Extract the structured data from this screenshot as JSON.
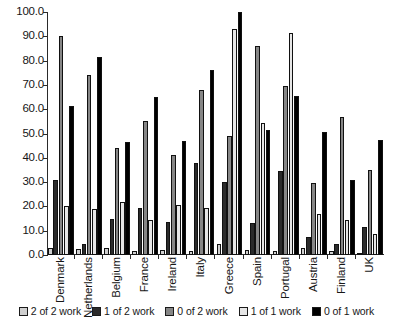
{
  "chart_data": {
    "type": "bar",
    "title": "",
    "xlabel": "",
    "ylabel": "",
    "ylim": [
      0,
      100
    ],
    "yticks": [
      "0.0",
      "10.0",
      "20.0",
      "30.0",
      "40.0",
      "50.0",
      "60.0",
      "70.0",
      "80.0",
      "90.0",
      "100.0"
    ],
    "ytick_values": [
      0,
      10,
      20,
      30,
      40,
      50,
      60,
      70,
      80,
      90,
      100
    ],
    "grid": false,
    "legend_position": "bottom",
    "categories": [
      "Denmark",
      "Netherlands",
      "Belgium",
      "France",
      "Ireland",
      "Italy",
      "Greece",
      "Spain",
      "Portugal",
      "Austria",
      "Finland",
      "UK"
    ],
    "series": [
      {
        "name": "2 of 2 work",
        "color": "#cfcfcf",
        "values": [
          2.8,
          2.5,
          3.0,
          1.8,
          2.2,
          1.5,
          4.5,
          2.0,
          1.6,
          3.0,
          1.5,
          1.0
        ]
      },
      {
        "name": "1 of 2 work",
        "color": "#2b2b2b",
        "values": [
          31.0,
          4.5,
          15.0,
          19.5,
          13.5,
          38.0,
          30.0,
          13.0,
          34.5,
          7.5,
          4.5,
          11.5
        ]
      },
      {
        "name": "0 of 2 work",
        "color": "#868686",
        "values": [
          90.0,
          74.0,
          44.0,
          55.0,
          41.0,
          68.0,
          49.0,
          86.0,
          69.5,
          29.5,
          57.0,
          35.0
        ]
      },
      {
        "name": "1 of 1 work",
        "color": "#e6e6e6",
        "values": [
          20.0,
          19.0,
          22.0,
          14.5,
          20.5,
          19.5,
          93.0,
          54.5,
          91.5,
          17.0,
          14.5,
          8.5
        ]
      },
      {
        "name": "0 of 1 work",
        "color": "#000000",
        "values": [
          61.5,
          81.5,
          46.5,
          65.0,
          47.0,
          76.0,
          100.0,
          51.5,
          65.5,
          50.5,
          31.0,
          47.5
        ]
      }
    ]
  }
}
